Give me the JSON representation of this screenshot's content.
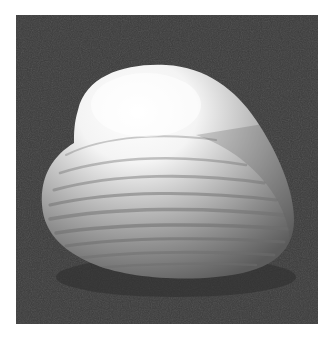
{
  "image": {
    "subject": "clam shell",
    "alt": "Black and white photograph of a clam shell on a dark background",
    "colors": {
      "background": "#3a3a3a",
      "shell_highlight": "#fbfbfb",
      "shell_mid": "#b5b5b5",
      "shell_shadow": "#6a6a6a",
      "border": "#ffffff"
    }
  }
}
